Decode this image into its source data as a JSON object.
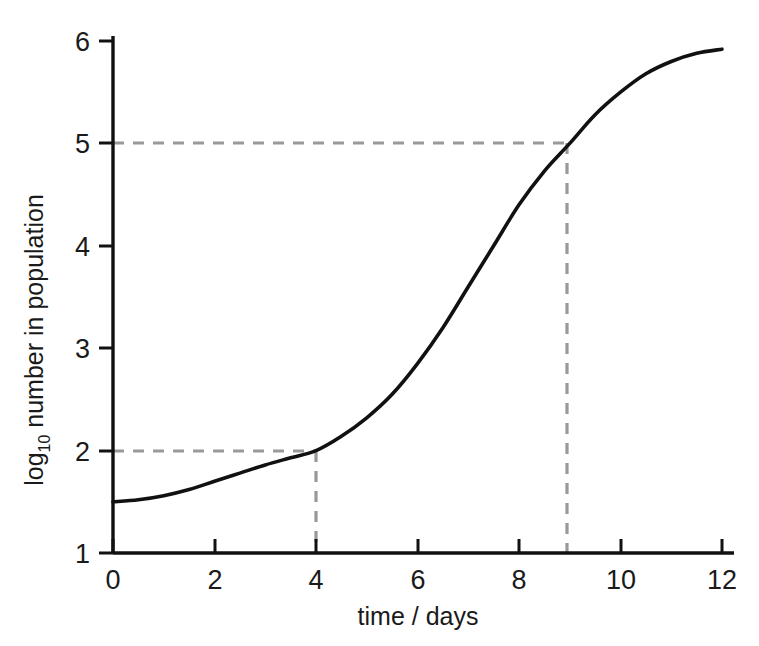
{
  "chart_data": {
    "type": "line",
    "title": "",
    "subtitle": "",
    "xlabel": "time / days",
    "ylabel_main": "number in population",
    "ylabel_prefix": "log",
    "ylabel_subscript": "10",
    "ylabel_full": "log10 number in population",
    "xlim": [
      0,
      12
    ],
    "ylim": [
      1,
      6
    ],
    "xticks": [
      0,
      2,
      4,
      6,
      8,
      10,
      12
    ],
    "xtick_labels": [
      "0",
      "2",
      "4",
      "6",
      "8",
      "10",
      "12"
    ],
    "yticks": [
      1,
      2,
      3,
      4,
      5,
      6
    ],
    "ytick_labels": [
      "1",
      "2",
      "3",
      "4",
      "5",
      "6"
    ],
    "grid": false,
    "legend": false,
    "legend_position": "none",
    "series": [
      {
        "name": "log10 number in population",
        "style": "solid",
        "color": "#111111",
        "x": [
          0,
          0.5,
          1,
          1.5,
          2,
          2.5,
          3,
          3.5,
          4,
          4.5,
          5,
          5.5,
          6,
          6.5,
          7,
          7.5,
          8,
          8.5,
          9,
          9.5,
          10,
          10.5,
          11,
          11.5,
          12
        ],
        "values": [
          1.5,
          1.52,
          1.56,
          1.62,
          1.7,
          1.78,
          1.86,
          1.93,
          2.0,
          2.14,
          2.32,
          2.55,
          2.85,
          3.2,
          3.6,
          4.0,
          4.4,
          4.73,
          5.0,
          5.28,
          5.5,
          5.68,
          5.8,
          5.88,
          5.92
        ]
      }
    ],
    "annotations": [
      {
        "name": "construction-line-lower",
        "style": "dashed",
        "color": "#999999",
        "y_value": 2,
        "x_value": 4,
        "description": "dashed guideline from y = 2 across to the curve then down to x = 4"
      },
      {
        "name": "construction-line-upper",
        "style": "dashed",
        "color": "#999999",
        "y_value": 5,
        "x_value": 9,
        "description": "dashed guideline from y = 5 across to the curve then down to x = 9"
      }
    ],
    "colors": {
      "curve": "#111111",
      "axis": "#111111",
      "guideline": "#999999",
      "background": "#ffffff",
      "text": "#1a1a1a"
    }
  }
}
